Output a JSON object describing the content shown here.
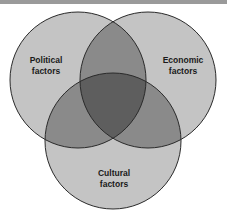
{
  "diagram": {
    "type": "venn",
    "sets": [
      {
        "id": "political",
        "line1": "Political",
        "line2": "factors"
      },
      {
        "id": "economic",
        "line1": "Economic",
        "line2": "factors"
      },
      {
        "id": "cultural",
        "line1": "Cultural",
        "line2": "factors"
      }
    ],
    "colors": {
      "single": "#c4c4c4",
      "pair": "#8a8a8a",
      "triple": "#5e5e5e",
      "stroke": "#2a2a2a",
      "topbar": "#9a9a9a"
    }
  }
}
